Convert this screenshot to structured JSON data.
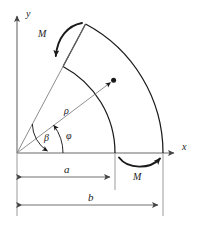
{
  "figure": {
    "type": "engineering-mechanics-diagram",
    "colors": {
      "stroke": "#1a1a1a",
      "axis": "#555555",
      "dimension": "#555555",
      "background": "#ffffff",
      "text": "#1a1a1a"
    }
  },
  "axes": {
    "y_label": "y",
    "x_label": "x",
    "origin_label": ""
  },
  "moments": {
    "upper_label": "M",
    "lower_label": "M"
  },
  "angles": {
    "beta_label": "β",
    "phi_label": "φ"
  },
  "radii": {
    "rho_label": "ρ"
  },
  "dimensions": {
    "inner_label": "a",
    "outer_label": "b"
  },
  "geometry": {
    "origin_x": 17,
    "origin_y": 153,
    "inner_radius": 98,
    "outer_radius": 146,
    "sector_angle_deg": 62,
    "beta_angle_deg": 38,
    "phi_angle_deg": 27,
    "rho_length": 112,
    "y_axis_top": 12,
    "x_axis_right": 178,
    "a_dimension_end": 115,
    "b_dimension_end": 163
  }
}
